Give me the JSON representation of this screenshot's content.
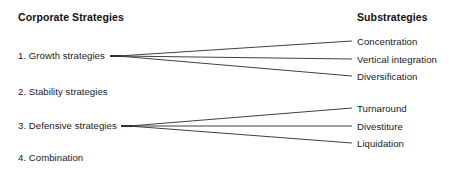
{
  "diagram": {
    "title_left": "Corporate Strategies",
    "title_right": "Substrategies",
    "strategies": [
      {
        "label": "1. Growth strategies"
      },
      {
        "label": "2. Stability strategies"
      },
      {
        "label": "3. Defensive strategies"
      },
      {
        "label": "4. Combination"
      }
    ],
    "substrategies": [
      {
        "label": "Concentration"
      },
      {
        "label": "Vertical integration"
      },
      {
        "label": "Diversification"
      },
      {
        "label": "Turnaround"
      },
      {
        "label": "Divestiture"
      },
      {
        "label": "Liquidation"
      }
    ],
    "colors": {
      "background": "#ffffff",
      "text": "#1a1a1a",
      "heading": "#111111",
      "connector": "#2b2b2b"
    }
  }
}
